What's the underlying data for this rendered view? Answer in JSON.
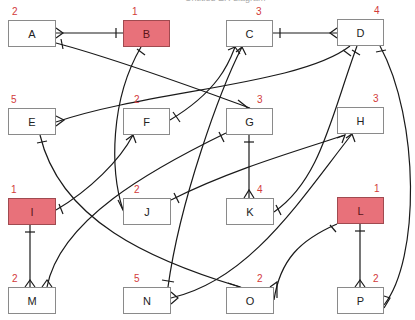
{
  "diagram": {
    "title": "Untitled ER diagram",
    "highlight_color": "#e8717a",
    "count_color": "#d23a3a",
    "entities": [
      {
        "id": "A",
        "label": "A",
        "count": "2",
        "x": 8,
        "y": 20,
        "w": 48,
        "h": 27,
        "highlight": false
      },
      {
        "id": "B",
        "label": "B",
        "count": "1",
        "x": 123,
        "y": 20,
        "w": 47,
        "h": 27,
        "highlight": true
      },
      {
        "id": "C",
        "label": "C",
        "count": "3",
        "x": 226,
        "y": 20,
        "w": 47,
        "h": 27,
        "highlight": false
      },
      {
        "id": "D",
        "label": "D",
        "count": "4",
        "x": 337,
        "y": 19,
        "w": 47,
        "h": 27,
        "highlight": false
      },
      {
        "id": "E",
        "label": "E",
        "count": "5",
        "x": 8,
        "y": 108,
        "w": 48,
        "h": 27,
        "highlight": false
      },
      {
        "id": "F",
        "label": "F",
        "count": "2",
        "x": 123,
        "y": 108,
        "w": 47,
        "h": 27,
        "highlight": false
      },
      {
        "id": "G",
        "label": "G",
        "count": "3",
        "x": 226,
        "y": 108,
        "w": 47,
        "h": 27,
        "highlight": false
      },
      {
        "id": "H",
        "label": "H",
        "count": "3",
        "x": 337,
        "y": 107,
        "w": 47,
        "h": 27,
        "highlight": false
      },
      {
        "id": "I",
        "label": "I",
        "count": "1",
        "x": 8,
        "y": 198,
        "w": 48,
        "h": 27,
        "highlight": true
      },
      {
        "id": "J",
        "label": "J",
        "count": "2",
        "x": 123,
        "y": 198,
        "w": 48,
        "h": 27,
        "highlight": false
      },
      {
        "id": "K",
        "label": "K",
        "count": "4",
        "x": 226,
        "y": 198,
        "w": 48,
        "h": 27,
        "highlight": false
      },
      {
        "id": "L",
        "label": "L",
        "count": "1",
        "x": 337,
        "y": 197,
        "w": 47,
        "h": 27,
        "highlight": true
      },
      {
        "id": "M",
        "label": "M",
        "count": "2",
        "x": 8,
        "y": 287,
        "w": 48,
        "h": 27,
        "highlight": false
      },
      {
        "id": "N",
        "label": "N",
        "count": "5",
        "x": 123,
        "y": 287,
        "w": 48,
        "h": 27,
        "highlight": false
      },
      {
        "id": "O",
        "label": "O",
        "count": "2",
        "x": 226,
        "y": 287,
        "w": 48,
        "h": 27,
        "highlight": false
      },
      {
        "id": "P",
        "label": "P",
        "count": "2",
        "x": 337,
        "y": 287,
        "w": 47,
        "h": 27,
        "highlight": false
      }
    ],
    "relationships": [
      {
        "from": "B",
        "to": "A",
        "from_end": "one",
        "to_end": "many"
      },
      {
        "from": "C",
        "to": "D",
        "from_end": "one",
        "to_end": "many"
      },
      {
        "from": "A",
        "to": "G",
        "from_end": "one",
        "to_end": "many"
      },
      {
        "from": "B",
        "to": "J",
        "from_end": "one",
        "to_end": "many"
      },
      {
        "from": "D",
        "to": "E",
        "from_end": "one",
        "to_end": "many"
      },
      {
        "from": "F",
        "to": "C",
        "from_end": "one",
        "to_end": "many"
      },
      {
        "from": "N",
        "to": "C",
        "from_end": "one",
        "to_end": "many"
      },
      {
        "from": "D",
        "to": "K",
        "from_end": "one",
        "to_end": "many"
      },
      {
        "from": "D",
        "to": "P",
        "from_end": "one",
        "to_end": "many"
      },
      {
        "from": "E",
        "to": "O",
        "from_end": "one",
        "to_end": "many"
      },
      {
        "from": "I",
        "to": "F",
        "from_end": "one",
        "to_end": "many"
      },
      {
        "from": "G",
        "to": "K",
        "from_end": "one",
        "to_end": "many"
      },
      {
        "from": "G",
        "to": "M",
        "from_end": "one",
        "to_end": "many"
      },
      {
        "from": "J",
        "to": "H",
        "from_end": "one",
        "to_end": "many"
      },
      {
        "from": "I",
        "to": "M",
        "from_end": "one",
        "to_end": "many"
      },
      {
        "from": "L",
        "to": "O",
        "from_end": "one",
        "to_end": "many"
      },
      {
        "from": "L",
        "to": "P",
        "from_end": "one",
        "to_end": "many"
      },
      {
        "from": "H",
        "to": "N",
        "from_end": "many",
        "to_end": "many"
      }
    ]
  }
}
